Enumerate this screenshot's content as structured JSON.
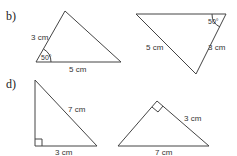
{
  "parts": [
    {
      "label": "b)",
      "triangles": [
        {
          "side_labels": [
            "3 cm",
            "5 cm"
          ],
          "angle_label": "50°",
          "marked_angle": "between 3 cm and 5 cm sides"
        },
        {
          "side_labels": [
            "5 cm",
            "3 cm"
          ],
          "angle_label": "50°",
          "marked_angle": "top-right vertex"
        }
      ]
    },
    {
      "label": "d)",
      "triangles": [
        {
          "side_labels": [
            "7 cm",
            "3 cm"
          ],
          "right_angle": true,
          "marked_angle": "bottom-left vertex"
        },
        {
          "side_labels": [
            "3 cm",
            "7 cm"
          ],
          "right_angle": true,
          "marked_angle": "apex"
        }
      ]
    }
  ]
}
